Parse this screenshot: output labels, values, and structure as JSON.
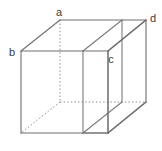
{
  "figure": {
    "type": "line-diagram",
    "canvas": {
      "width": 162,
      "height": 151,
      "background": "#ffffff"
    },
    "style": {
      "solid_edge_color": "#6e6e6e",
      "hidden_edge_color": "#8a8a8a",
      "plane_edge_color": "#7a7a7a",
      "label_color": "#3a3a3a",
      "solid_edge_width": 1.1,
      "hidden_edge_width": 1.0,
      "hidden_edge_dash": "1.4 2.2",
      "label_font_size": 11
    },
    "labels": [
      {
        "id": "a",
        "text": "a",
        "x": 59,
        "y": 16,
        "vertex": "back-top-left",
        "anchor_vertex": [
          60,
          20
        ]
      },
      {
        "id": "b",
        "text": "b",
        "x": 12,
        "y": 56,
        "vertex": "front-top-left",
        "anchor_vertex": [
          21,
          51
        ]
      },
      {
        "id": "c",
        "text": "c",
        "x": 111,
        "y": 63,
        "vertex": "plane-front-right-top",
        "anchor_vertex": [
          108,
          51
        ]
      },
      {
        "id": "d",
        "text": "d",
        "x": 153,
        "y": 22,
        "vertex": "back-top-right",
        "anchor_vertex": [
          146,
          20
        ]
      }
    ],
    "vertices": {
      "front_top_left": [
        21,
        51
      ],
      "front_top_right": [
        108,
        51
      ],
      "front_bottom_left": [
        21,
        133
      ],
      "front_bottom_right": [
        108,
        133
      ],
      "back_top_left": [
        60,
        20
      ],
      "back_top_right": [
        146,
        20
      ],
      "back_bottom_left": [
        60,
        102
      ],
      "back_bottom_right": [
        146,
        102
      ]
    },
    "plane_vertices": {
      "front_left_top": [
        83,
        51
      ],
      "front_left_bottom": [
        83,
        133
      ],
      "front_right_top": [
        108,
        51
      ],
      "front_right_bottom": [
        108,
        133
      ],
      "back_left_top": [
        122,
        20
      ],
      "back_left_bottom": [
        122,
        102
      ],
      "back_right_top": [
        146,
        20
      ],
      "back_right_bottom": [
        146,
        102
      ]
    },
    "edges": {
      "solid_count": 12,
      "hidden_count": 3,
      "plane_count": 6
    }
  }
}
